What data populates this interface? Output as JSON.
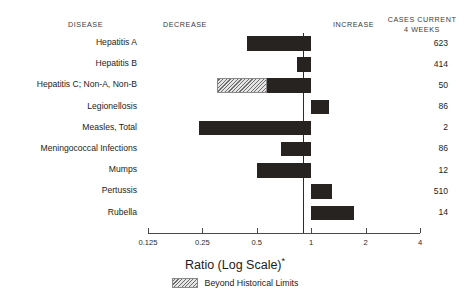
{
  "headers": {
    "disease": "DISEASE",
    "decrease": "DECREASE",
    "increase": "INCREASE",
    "cases_line1": "CASES CURRENT",
    "cases_line2": "4 WEEKS"
  },
  "axis_title": "Ratio (Log Scale)",
  "axis_title_footnote": "*",
  "legend": {
    "hatch_label": "Beyond Historical Limits"
  },
  "colors": {
    "bar": "#262321",
    "hatch_light": "#e4e4e4",
    "hatch_dark": "#6d6d6d",
    "axis": "#4a4a4a",
    "text": "#1b1b1b",
    "background": "#ffffff"
  },
  "chart_data": {
    "type": "bar",
    "orientation": "horizontal",
    "title": "Ratio (Log Scale)*",
    "xlabel": "Ratio (Log Scale)*",
    "ylabel": "DISEASE",
    "scale": "log2",
    "xlim": [
      0.125,
      4
    ],
    "reference_value": 1,
    "grid": false,
    "legend_position": "bottom-center",
    "tick_labels": [
      "0.125",
      "0.25",
      "0.5",
      "1",
      "2",
      "4"
    ],
    "tick_values": [
      0.125,
      0.25,
      0.5,
      1,
      2,
      4
    ],
    "categories": [
      "Hepatitis A",
      "Hepatitis B",
      "Hepatitis C; Non-A, Non-B",
      "Legionellosis",
      "Measles, Total",
      "Meningococcal Infections",
      "Mumps",
      "Pertussis",
      "Rubella"
    ],
    "values": [
      0.44,
      0.83,
      0.3,
      1.25,
      0.24,
      0.68,
      0.5,
      1.3,
      1.72
    ],
    "cases_current_4_weeks": [
      623,
      414,
      50,
      86,
      2,
      86,
      12,
      510,
      14
    ],
    "beyond_historical_limits": [
      false,
      false,
      true,
      false,
      false,
      false,
      false,
      false,
      false
    ],
    "beyond_limit_extent": [
      null,
      null,
      0.57,
      null,
      null,
      null,
      null,
      null,
      null
    ],
    "rows": [
      {
        "disease": "Hepatitis A",
        "ratio": 0.44,
        "cases": "623",
        "hatched": false,
        "hatch_to": null
      },
      {
        "disease": "Hepatitis B",
        "ratio": 0.83,
        "cases": "414",
        "hatched": false,
        "hatch_to": null
      },
      {
        "disease": "Hepatitis C; Non-A, Non-B",
        "ratio": 0.3,
        "cases": "50",
        "hatched": true,
        "hatch_to": 0.57
      },
      {
        "disease": "Legionellosis",
        "ratio": 1.25,
        "cases": "86",
        "hatched": false,
        "hatch_to": null
      },
      {
        "disease": "Measles, Total",
        "ratio": 0.24,
        "cases": "2",
        "hatched": false,
        "hatch_to": null
      },
      {
        "disease": "Meningococcal Infections",
        "ratio": 0.68,
        "cases": "86",
        "hatched": false,
        "hatch_to": null
      },
      {
        "disease": "Mumps",
        "ratio": 0.5,
        "cases": "12",
        "hatched": false,
        "hatch_to": null
      },
      {
        "disease": "Pertussis",
        "ratio": 1.3,
        "cases": "510",
        "hatched": false,
        "hatch_to": null
      },
      {
        "disease": "Rubella",
        "ratio": 1.72,
        "cases": "14",
        "hatched": false,
        "hatch_to": null
      }
    ]
  }
}
